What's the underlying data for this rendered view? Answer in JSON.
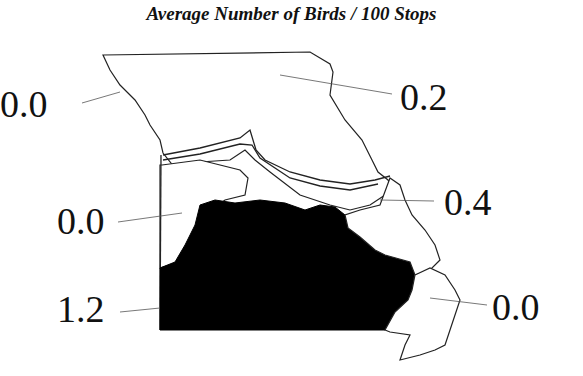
{
  "title": "Average Number of Birds / 100 Stops",
  "map": {
    "region": "Missouri",
    "fill_colors": {
      "highlight": "#000000",
      "default": "#ffffff",
      "outline": "#222222"
    },
    "regions": [
      {
        "name": "northwest",
        "value": "0.0"
      },
      {
        "name": "north",
        "value": "0.2"
      },
      {
        "name": "west-central",
        "value": "0.0"
      },
      {
        "name": "east-central",
        "value": "0.4"
      },
      {
        "name": "ozarks-south",
        "value": "1.2",
        "highlighted": true
      },
      {
        "name": "southeast",
        "value": "0.0"
      }
    ]
  }
}
